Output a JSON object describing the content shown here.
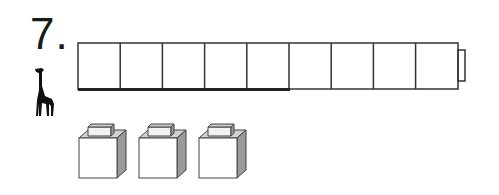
{
  "problem": {
    "number_label": "7.",
    "icon": "giraffe-icon"
  },
  "measure_strip": {
    "cell_count": 9,
    "highlighted_cells": 5,
    "end_tab": true
  },
  "cubes": {
    "count": 3,
    "icon": "connecting-cube-icon"
  },
  "colors": {
    "line": "#333333",
    "cube_side": "#9a9a9a",
    "cube_top": "#c8c8c8"
  }
}
